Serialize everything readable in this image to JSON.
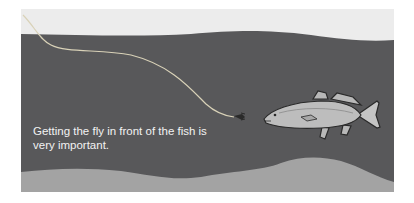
{
  "illustration": {
    "subject": "fly fishing diagram",
    "caption_line1": "Getting the fly in front of the fish is",
    "caption_line2": "very important.",
    "colors": {
      "surface": "#ececec",
      "water": "#58585a",
      "bottom": "#a3a3a3",
      "line": "#d9d2b8",
      "fish_body": "#bdbdbd",
      "fish_outline": "#2a2a2a"
    }
  }
}
